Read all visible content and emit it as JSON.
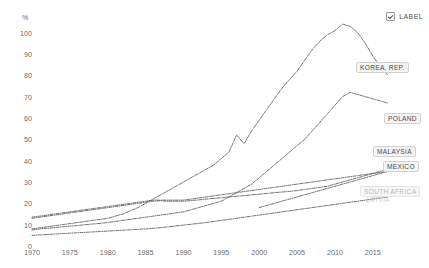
{
  "legend": {
    "checkbox_checked": true,
    "label": "LABEL",
    "checkbox_icon": "check-icon"
  },
  "axis": {
    "y_unit": "%",
    "y_ticks": [
      "0",
      "10",
      "20",
      "30",
      "40",
      "50",
      "60",
      "70",
      "80",
      "90",
      "100"
    ],
    "x_ticks": [
      "1970",
      "1975",
      "1980",
      "1985",
      "1990",
      "1995",
      "2000",
      "2005",
      "2010",
      "2015"
    ]
  },
  "series_labels": [
    {
      "name": "KOREA, REP.",
      "style": "normal"
    },
    {
      "name": "POLAND",
      "style": "normal"
    },
    {
      "name": "MALAYSIA",
      "style": "normal"
    },
    {
      "name": "MEXICO",
      "style": "normal"
    },
    {
      "name": "SOUTH AFRICA",
      "style": "faint"
    },
    {
      "name": "LATVIA",
      "style": "vfaint"
    }
  ],
  "chart_data": {
    "type": "line",
    "title": "",
    "xlabel": "",
    "ylabel": "%",
    "xlim": [
      1970,
      2017
    ],
    "ylim": [
      0,
      105
    ],
    "grid": false,
    "legend_position": "right-inline-labels",
    "line_style": "dash-dot",
    "color": "#5a5a5a",
    "x": [
      1970,
      1971,
      1972,
      1973,
      1974,
      1975,
      1976,
      1977,
      1978,
      1979,
      1980,
      1981,
      1982,
      1983,
      1984,
      1985,
      1986,
      1987,
      1988,
      1989,
      1990,
      1991,
      1992,
      1993,
      1994,
      1995,
      1996,
      1997,
      1998,
      1999,
      2000,
      2001,
      2002,
      2003,
      2004,
      2005,
      2006,
      2007,
      2008,
      2009,
      2010,
      2011,
      2012,
      2013,
      2014,
      2015,
      2016,
      2017
    ],
    "series": [
      {
        "name": "KOREA, REP.",
        "values": [
          8,
          8.5,
          9,
          9.5,
          10,
          10.5,
          11,
          11.5,
          12,
          12.5,
          13,
          14,
          15,
          16.5,
          18,
          20,
          22,
          24,
          26,
          28,
          30,
          32,
          34,
          36,
          38,
          41,
          44,
          52,
          48,
          54,
          59,
          64,
          69,
          74,
          78,
          82,
          87,
          92,
          96,
          99,
          101,
          104,
          103,
          100,
          95,
          89,
          84,
          80
        ]
      },
      {
        "name": "POLAND",
        "values": [
          7.5,
          8,
          8.3,
          8.6,
          9,
          9.3,
          9.6,
          10,
          10.3,
          10.6,
          11,
          11.5,
          12,
          12.5,
          13,
          13.5,
          14,
          14.5,
          15,
          15.5,
          16,
          17,
          18,
          19,
          20,
          21,
          23,
          25,
          27,
          29,
          32,
          35,
          38,
          41,
          44,
          47,
          50,
          54,
          58,
          62,
          66,
          70,
          72,
          71,
          70,
          69,
          68,
          67
        ]
      },
      {
        "name": "MALAYSIA",
        "values": [
          13,
          13.5,
          14,
          14.5,
          15,
          15.5,
          16,
          16.5,
          17,
          17.5,
          18,
          18.5,
          19,
          19.5,
          20,
          20.5,
          21,
          21.2,
          21,
          21,
          21,
          21.3,
          21.6,
          22,
          22.3,
          22.6,
          23,
          23.3,
          23.6,
          24,
          24.3,
          24.6,
          25,
          25.3,
          25.6,
          26,
          26.5,
          27,
          27.5,
          28,
          29,
          30,
          31,
          32,
          33,
          34,
          35,
          36
        ]
      },
      {
        "name": "MEXICO",
        "values": [
          13.5,
          14,
          14.5,
          15,
          15.5,
          16,
          16.5,
          17,
          17.5,
          18,
          18.5,
          19,
          19.5,
          20,
          20.5,
          21,
          21.5,
          21.5,
          21.5,
          21.5,
          21.5,
          22,
          22.5,
          23,
          23.5,
          24,
          24.5,
          25,
          25.5,
          26,
          26.5,
          27,
          27.5,
          28,
          28.5,
          29,
          29.5,
          30,
          30.5,
          31,
          31.5,
          32,
          32.5,
          33,
          33.5,
          34,
          34.5,
          35
        ]
      },
      {
        "name": "SOUTH AFRICA",
        "values": [
          5,
          5.2,
          5.4,
          5.6,
          5.8,
          6,
          6.2,
          6.4,
          6.6,
          6.8,
          7,
          7.2,
          7.4,
          7.6,
          7.8,
          8,
          8.3,
          8.6,
          9,
          9.4,
          9.8,
          10.2,
          10.6,
          11,
          11.5,
          12,
          12.5,
          13,
          13.5,
          14,
          14.5,
          15,
          15.5,
          16,
          16.5,
          17,
          17.5,
          18,
          18.5,
          19,
          19.5,
          20,
          20.5,
          21,
          21.5,
          22,
          22.5,
          23
        ]
      },
      {
        "name": "LATVIA",
        "values": [
          null,
          null,
          null,
          null,
          null,
          null,
          null,
          null,
          null,
          null,
          null,
          null,
          null,
          null,
          null,
          null,
          null,
          null,
          null,
          null,
          null,
          null,
          null,
          null,
          null,
          null,
          null,
          null,
          null,
          null,
          18,
          19,
          20,
          21,
          22,
          23,
          24,
          25,
          26,
          27,
          28,
          29,
          30,
          31,
          32,
          33,
          34,
          35
        ]
      }
    ]
  }
}
